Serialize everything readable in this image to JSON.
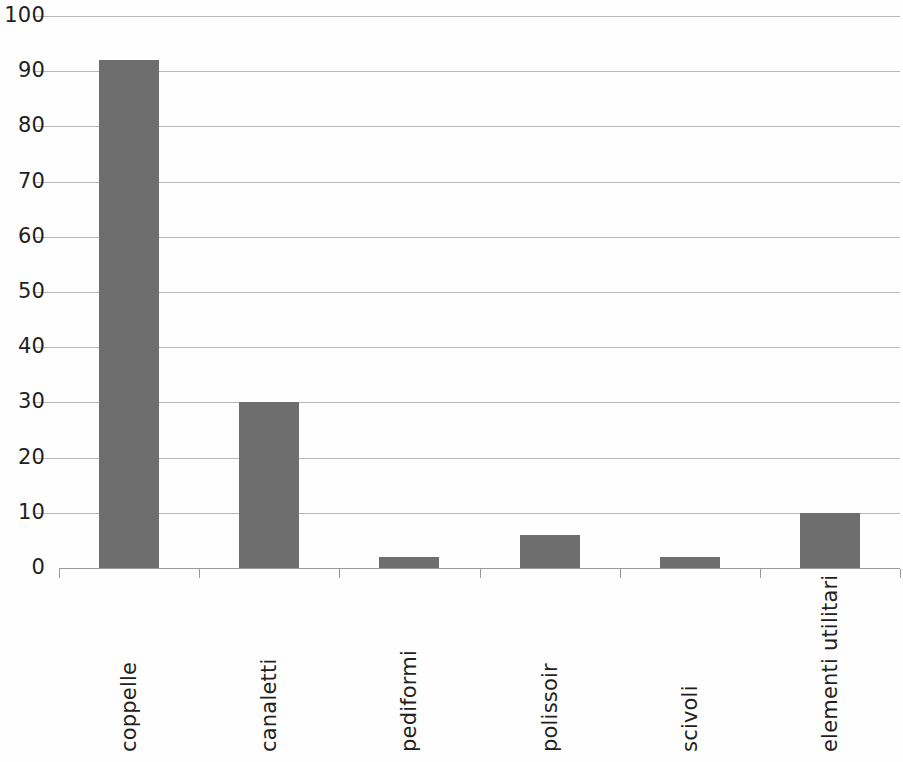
{
  "chart_data": {
    "type": "bar",
    "title": "",
    "subtitle": "",
    "xlabel": "",
    "ylabel": "",
    "categories": [
      "coppelle",
      "canaletti",
      "pediformi",
      "polissoir",
      "scivoli",
      "elementi utilitari"
    ],
    "values": [
      92,
      30,
      2,
      6,
      2,
      10
    ],
    "ylim": [
      0,
      100
    ],
    "ytick_labels": [
      "0",
      "10",
      "20",
      "30",
      "40",
      "50",
      "60",
      "70",
      "80",
      "90",
      "100"
    ],
    "ytick_values": [
      0,
      10,
      20,
      30,
      40,
      50,
      60,
      70,
      80,
      90,
      100
    ],
    "grid": "horizontal",
    "legend": "none",
    "series": [
      {
        "name": "",
        "values": [
          92,
          30,
          2,
          6,
          2,
          10
        ]
      }
    ],
    "bar_color": "#6e6e6e",
    "gridline_color": "#b8b8b8",
    "axis_color": "#9a9a9a",
    "text_color": "#231f20",
    "background_color": "#ffffff",
    "xtick_label_rotation": -90
  }
}
